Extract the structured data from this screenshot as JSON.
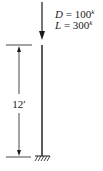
{
  "diagram": {
    "type": "column-axial-load",
    "loads": [
      {
        "symbol": "D",
        "value": "100",
        "unit": "k"
      },
      {
        "symbol": "L",
        "value": "300",
        "unit": "k"
      }
    ],
    "dimension": {
      "label": "12′"
    },
    "support": "fixed-base",
    "colors": {
      "line": "#1a1a1a",
      "background": "#ffffff"
    }
  }
}
